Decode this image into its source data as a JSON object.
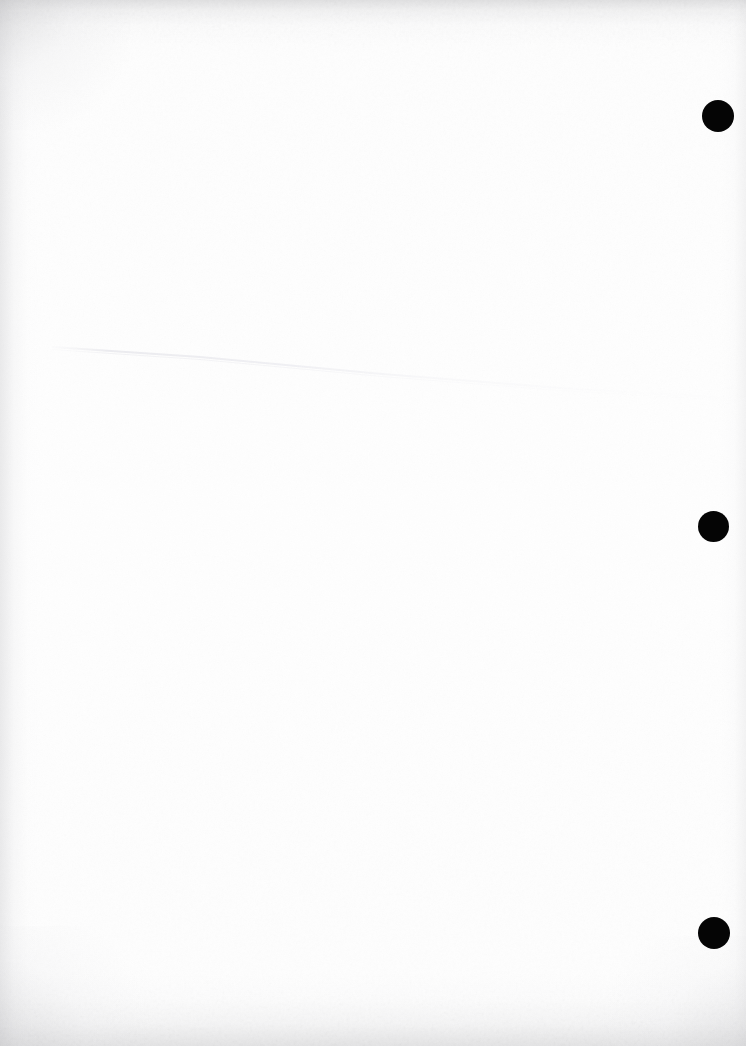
{
  "page": {
    "kind": "scanned-blank-document-page",
    "width": 746,
    "height": 1046,
    "background_color": "#ffffff",
    "paper_color": "#fefefe",
    "orientation": "portrait",
    "visible_text": "",
    "note": ""
  },
  "marks": {
    "label": "registration marks",
    "color": "#050505",
    "count": 3,
    "items": [
      {
        "name": "registration-mark-top",
        "cx": 718,
        "cy": 116,
        "d": 32
      },
      {
        "name": "registration-mark-middle",
        "cx": 713,
        "cy": 526,
        "d": 31
      },
      {
        "name": "registration-mark-bottom",
        "cx": 714,
        "cy": 933,
        "d": 32
      }
    ]
  },
  "crease": {
    "label": "fold crease",
    "color": "#f2f2f4",
    "start_x": 55,
    "start_y": 348,
    "mid_x": 382,
    "mid_y": 375,
    "end_x": 746,
    "end_y": 400
  },
  "shading": {
    "top_edge_color": "#c4c4c6",
    "bottom_edge_color": "#c6c6c8",
    "left_edge_color": "#ceced1",
    "right_edge_color": "#d6d6d8"
  }
}
